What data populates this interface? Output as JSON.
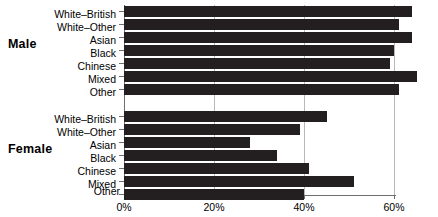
{
  "chart_data": {
    "type": "bar",
    "orientation": "horizontal",
    "title": "",
    "xlabel": "",
    "ylabel": "",
    "xlim": [
      0,
      68
    ],
    "xticks": [
      0,
      20,
      40,
      60
    ],
    "xticklabels": [
      "0%",
      "20%",
      "40%",
      "60%"
    ],
    "grid": true,
    "legend": "none",
    "groups": [
      {
        "name": "Male",
        "categories": [
          "White–British",
          "White–Other",
          "Asian",
          "Black",
          "Chinese",
          "Mixed",
          "Other"
        ],
        "values": [
          64,
          61,
          64,
          60,
          59,
          65,
          61
        ]
      },
      {
        "name": "Female",
        "categories": [
          "White–British",
          "White–Other",
          "Asian",
          "Black",
          "Chinese",
          "Mixed",
          "Other"
        ],
        "values": [
          45,
          39,
          28,
          34,
          41,
          51,
          40
        ]
      }
    ],
    "bar_color": "#231f20",
    "axis_color": "#6f6f6f",
    "grid_color": "#b9b9b9"
  },
  "labels": {
    "male": "Male",
    "female": "Female",
    "male_cats": [
      "White–British",
      "White–Other",
      "Asian",
      "Black",
      "Chinese",
      "Mixed",
      "Other"
    ],
    "female_cats": [
      "White–British",
      "White–Other",
      "Asian",
      "Black",
      "Chinese",
      "Mixed",
      "Other"
    ],
    "ticks": [
      "0%",
      "20%",
      "40%",
      "60%"
    ]
  }
}
